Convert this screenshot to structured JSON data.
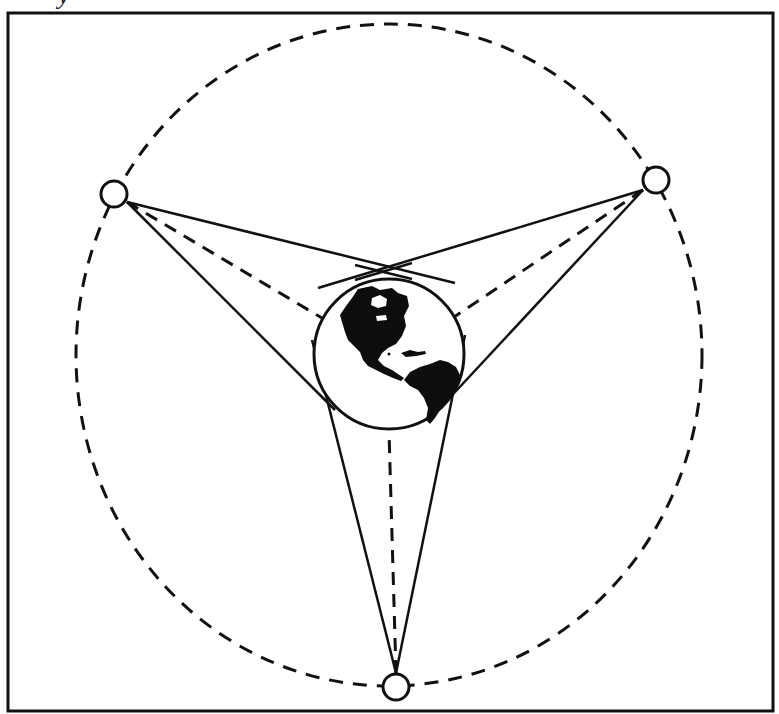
{
  "figure": {
    "caption_fragment": "y",
    "colors": {
      "stroke": "#111111",
      "background": "#ffffff",
      "land": "#0d0d0d"
    },
    "frame": {
      "x": 8,
      "y": 13,
      "width": 765,
      "height": 698
    },
    "orbit": {
      "cx": 389,
      "cy": 355,
      "rx": 313,
      "ry": 331,
      "style": "dashed"
    },
    "earth": {
      "cx": 389,
      "cy": 354,
      "r": 75,
      "label": "Earth (Americas view)"
    },
    "satellites": [
      {
        "id": "left",
        "cx": 114,
        "cy": 194,
        "r": 13,
        "apex": [
          127,
          202
        ]
      },
      {
        "id": "right",
        "cx": 656,
        "cy": 180,
        "r": 13,
        "apex": [
          643,
          190
        ]
      },
      {
        "id": "bottom",
        "cx": 396,
        "cy": 687,
        "r": 13,
        "apex": [
          396,
          673
        ]
      }
    ],
    "coverage_lines": [
      {
        "from": "left",
        "tangent_a": [
          383,
          272
        ],
        "tangent_b": [
          328,
          400
        ]
      },
      {
        "from": "right",
        "tangent_a": [
          383,
          272
        ],
        "tangent_b": [
          452,
          393
        ]
      },
      {
        "from": "bottom",
        "tangent_a": [
          325,
          392
        ],
        "tangent_b": [
          452,
          395
        ]
      }
    ]
  }
}
